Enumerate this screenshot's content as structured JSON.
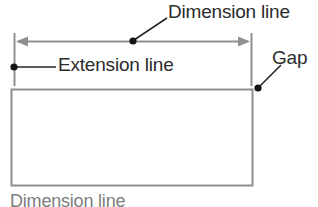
{
  "figure": {
    "background_color": "#ffffff",
    "line_color": "#8c8c8c",
    "leader_color": "#2b2b2b",
    "text_color": "#2b2b2b"
  },
  "labels": {
    "dimension_line_top": "Dimension line",
    "extension_line": "Extension line",
    "gap": "Gap",
    "dimension_line_bottom": "Dimension line"
  },
  "geometry": {
    "rectangle": {
      "x": 11,
      "y": 89,
      "width": 242,
      "height": 97
    },
    "dimension_line": {
      "x1": 16,
      "x2": 250,
      "y": 41
    },
    "left_extension_line": {
      "x": 14,
      "y1": 33,
      "y2": 86
    },
    "right_extension_line": {
      "x": 251,
      "y1": 33,
      "y2": 86
    },
    "dimension_leader": {
      "dot_x": 133,
      "dot_y": 41,
      "end_x": 166,
      "end_y": 19
    },
    "extension_leader": {
      "dot_x": 14,
      "dot_y": 67,
      "end_x": 55,
      "end_y": 67
    },
    "gap_leader": {
      "dot_x": 258,
      "dot_y": 87,
      "end_x": 280,
      "end_y": 66
    }
  }
}
